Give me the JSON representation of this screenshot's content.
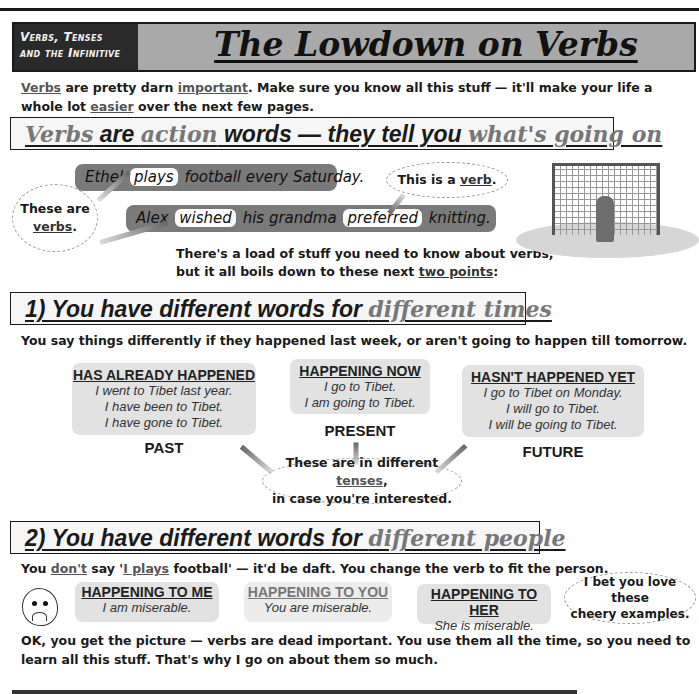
{
  "header": {
    "section_tag_line1": "Verbs, Tenses",
    "section_tag_line2": "and the Infinitive",
    "title": "The Lowdown on Verbs"
  },
  "intro": {
    "w1": "Verbs",
    "t1": " are pretty darn ",
    "w2": "important",
    "t2": ".  Make sure you know all this stuff — it'll make your life a whole lot ",
    "w3": "easier",
    "t3": " over the next few pages."
  },
  "heading1": {
    "p1": "Verbs",
    "p2": " are ",
    "p3": "action",
    "p4": " words — they tell you ",
    "p5": "what's going on"
  },
  "examples": {
    "s1": {
      "before": "Ethel",
      "verb": "plays",
      "after": "football every Saturday."
    },
    "s2": {
      "before": "Alex",
      "verb1": "wished",
      "middle": "his grandma",
      "verb2": "preferred",
      "after": "knitting."
    }
  },
  "callouts": {
    "these_are": "These are",
    "verbs": "verbs",
    "this_is_a": "This is a ",
    "verb": "verb",
    "tenses_pre": "These are in different ",
    "tenses_word": "tenses",
    "tenses_post": "in case you're interested.",
    "cheery_1": "I bet you love these",
    "cheery_2": "cheery examples."
  },
  "points_text": {
    "line1": "There's a load of stuff you need to know about verbs,",
    "line2_pre": "but it all boils down to these next ",
    "line2_link": "two points",
    "line2_post": ":"
  },
  "heading2": {
    "main": "1)  You have different words for ",
    "grey": "different times"
  },
  "sub1": "You say things differently if they happened last week, or aren't going to happen till tomorrow.",
  "tenses": [
    {
      "heading": "HAS ALREADY HAPPENED",
      "lines": [
        "I went to Tibet last year.",
        "I have been to Tibet.",
        "I have gone to Tibet."
      ],
      "label": "PAST"
    },
    {
      "heading": "HAPPENING NOW",
      "lines": [
        "I go to Tibet.",
        "I am going to Tibet."
      ],
      "label": "PRESENT"
    },
    {
      "heading": "HASN'T HAPPENED YET",
      "lines": [
        "I go to Tibet on Monday.",
        "I will go to Tibet.",
        "I will be going to Tibet."
      ],
      "label": "FUTURE"
    }
  ],
  "heading3": {
    "main": "2)  You have different words for ",
    "grey": "different people"
  },
  "sub2": {
    "t1": "You ",
    "w1": "don't",
    "t2": " say '",
    "w2": "I plays",
    "t3": " football' — it'd be daft.  You change the verb to fit the person."
  },
  "people": [
    {
      "heading": "HAPPENING TO ME",
      "line": "I am miserable."
    },
    {
      "heading": "HAPPENING TO YOU",
      "line": "You are miserable."
    },
    {
      "heading": "HAPPENING TO HER",
      "line": "She is miserable."
    }
  ],
  "conclusion": "OK, you get the picture — verbs are dead important.  You use them all the time, so you need to learn all this stuff.  That's why I go on about them so much."
}
